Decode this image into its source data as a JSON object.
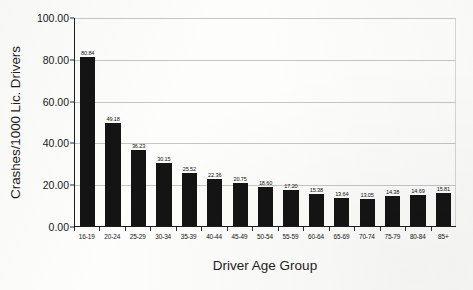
{
  "chart_data": {
    "type": "bar",
    "title": "",
    "subtitle": "",
    "xlabel": "Driver Age Group",
    "ylabel": "Crashes/1000 Lic. Drivers",
    "ylim": [
      0,
      100
    ],
    "ytick_step": 20,
    "ytick_labels": [
      "0.00",
      "20.00",
      "40.00",
      "60.00",
      "80.00",
      "100.00"
    ],
    "ytick_values": [
      0,
      20,
      40,
      60,
      80,
      100
    ],
    "grid": true,
    "grid_axis": "y",
    "legend": false,
    "legend_position": "none",
    "bar_color": "#141414",
    "categories": [
      "16-19",
      "20-24",
      "25-29",
      "30-34",
      "35-39",
      "40-44",
      "45-49",
      "50-54",
      "55-59",
      "60-64",
      "65-69",
      "70-74",
      "75-79",
      "80-84",
      "85+"
    ],
    "values": [
      80.84,
      49.18,
      36.23,
      30.15,
      25.52,
      22.36,
      20.75,
      18.6,
      17.2,
      15.38,
      13.64,
      13.05,
      14.38,
      14.69,
      15.81
    ],
    "data_labels": [
      "80.84",
      "49.18",
      "36.23",
      "30.15",
      "25.52",
      "22.36",
      "20.75",
      "18.60",
      "17.20",
      "15.38",
      "13.64",
      "13.05",
      "14.38",
      "14.69",
      "15.81"
    ]
  }
}
